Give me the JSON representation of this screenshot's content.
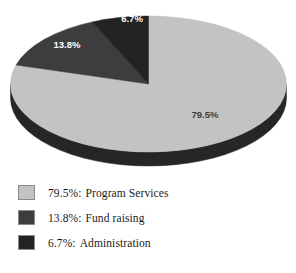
{
  "chart_data": {
    "type": "pie",
    "title": "",
    "subtitle": "",
    "xlabel": "",
    "ylabel": "",
    "legend_position": "bottom-left",
    "three_d": true,
    "start_angle_deg": 0,
    "direction": "clockwise",
    "categories": [
      "Program Services",
      "Fund raising",
      "Administration"
    ],
    "values": [
      79.5,
      13.8,
      6.7
    ],
    "value_unit": "%",
    "slices": [
      {
        "label": "Program Services",
        "value": 79.5,
        "display": "79.5%",
        "color": "#c3c3c3",
        "side_color": "#262626",
        "label_color": "#3c3c3c"
      },
      {
        "label": "Fund raising",
        "value": 13.8,
        "display": "13.8%",
        "color": "#3d3d3d",
        "side_color": "#1a1a1a",
        "label_color": "#ffffff"
      },
      {
        "label": "Administration",
        "value": 6.7,
        "display": "6.7%",
        "color": "#232323",
        "side_color": "#121212",
        "label_color": "#ffffff"
      }
    ],
    "data_labels": [
      {
        "text": "79.5%",
        "x": 205,
        "y": 118
      },
      {
        "text": "13.8%",
        "x": 67,
        "y": 48
      },
      {
        "text": "6.7%",
        "x": 132,
        "y": 22
      }
    ]
  },
  "legend": {
    "items": [
      {
        "percent": "79.5%:",
        "name": "Program Services",
        "swatch_color": "#c3c3c3",
        "swatch_name": "legend-swatch-program-services"
      },
      {
        "percent": "13.8%:",
        "name": "Fund raising",
        "swatch_color": "#3d3d3d",
        "swatch_name": "legend-swatch-fund-raising"
      },
      {
        "percent": "6.7%:",
        "name": "Administration",
        "swatch_color": "#232323",
        "swatch_name": "legend-swatch-administration"
      }
    ]
  }
}
